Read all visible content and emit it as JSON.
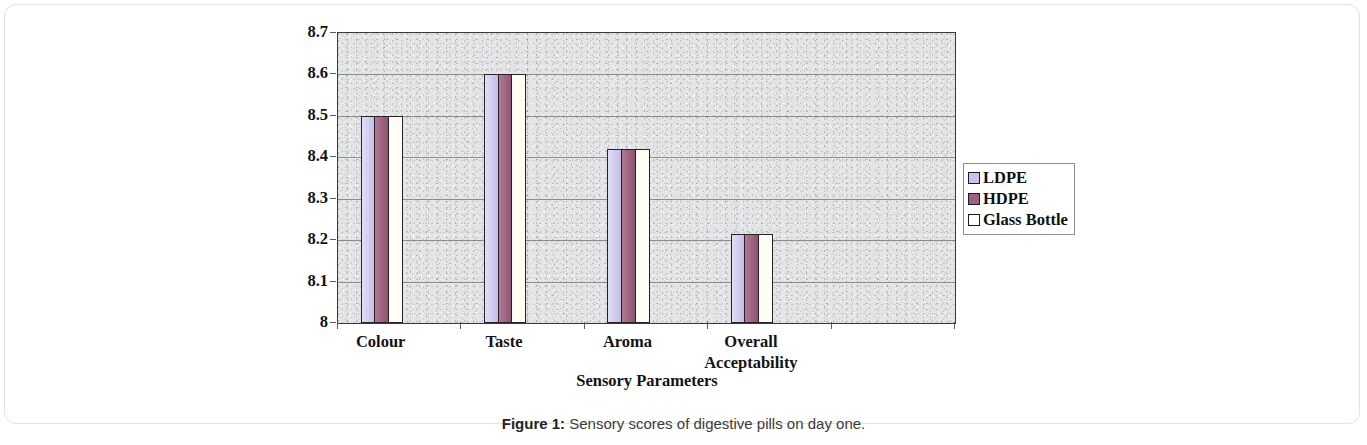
{
  "caption": {
    "label": "Figure 1:",
    "text": " Sensory scores of digestive pills on day one."
  },
  "legend": {
    "position": "right",
    "entries": [
      {
        "label": "LDPE",
        "color": "#c9c4ef",
        "swatch": "ldpe"
      },
      {
        "label": "HDPE",
        "color": "#a0607e",
        "swatch": "hdpe"
      },
      {
        "label": "Glass Bottle",
        "color": "#ffffff",
        "swatch": "glass"
      }
    ]
  },
  "chart_data": {
    "type": "bar",
    "title": "",
    "xlabel": "Sensory Parameters",
    "ylabel": "Sensory Scores",
    "categories": [
      "Colour",
      "Taste",
      "Aroma",
      "Overall\nAcceptability"
    ],
    "category_lines": [
      [
        "Colour"
      ],
      [
        "Taste"
      ],
      [
        "Aroma"
      ],
      [
        "Overall",
        "Acceptability"
      ]
    ],
    "series": [
      {
        "name": "LDPE",
        "color": "#c9c4ef",
        "values": [
          8.5,
          8.6,
          8.42,
          8.215
        ]
      },
      {
        "name": "HDPE",
        "color": "#a0607e",
        "values": [
          8.5,
          8.6,
          8.42,
          8.215
        ]
      },
      {
        "name": "Glass Bottle",
        "color": "#ffffff",
        "values": [
          8.5,
          8.6,
          8.42,
          8.215
        ]
      }
    ],
    "ylim": [
      8,
      8.7
    ],
    "ytick_values": [
      8,
      8.1,
      8.2,
      8.3,
      8.4,
      8.5,
      8.6,
      8.7
    ],
    "ytick_labels": [
      "8",
      "8.1",
      "8.2",
      "8.3",
      "8.4",
      "8.5",
      "8.6",
      "8.7"
    ],
    "grid": true,
    "grid_axis": "y",
    "plot_background": "#e3e4e6",
    "x_slot_count": 5
  }
}
